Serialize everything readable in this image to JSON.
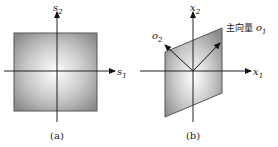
{
  "figure": {
    "panel_a": {
      "caption": "(a)",
      "x_axis_label": "s",
      "x_axis_sub": "1",
      "y_axis_label": "s",
      "y_axis_sub": "2",
      "shape": "square"
    },
    "panel_b": {
      "caption": "(b)",
      "x_axis_label": "x",
      "x_axis_sub": "1",
      "y_axis_label": "x",
      "y_axis_sub": "2",
      "shape": "parallelogram",
      "vector1_annotation": "主向量",
      "vector1_label": "o",
      "vector1_sub": "1",
      "vector2_label": "o",
      "vector2_sub": "2"
    },
    "colors": {
      "shape_edge": "#555555",
      "shape_fill_center": "#ffffff",
      "shape_fill_outer": "#8a8a8a",
      "axis": "#222222"
    }
  }
}
